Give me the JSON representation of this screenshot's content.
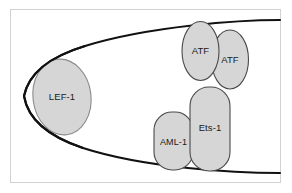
{
  "figure": {
    "background_color": "#ffffff",
    "frame_color": "#d2d2d2",
    "dna_stroke_color": "#111111",
    "protein_fill_color": "#d6d6d6",
    "protein_stroke_color": "#4a4a4a",
    "label_text_color": "#1a1a1a"
  },
  "dna": {
    "name": "bent-dna-strand",
    "description": "Sharply bent DNA duplex forming a loop that opens to the right",
    "upper_strand_label": "upper-dna-strand",
    "lower_strand_label": "lower-dna-strand"
  },
  "proteins": [
    {
      "id": "lef-1",
      "label": "LEF-1",
      "shape": "ellipse",
      "position": "left-apex-of-dna-bend"
    },
    {
      "id": "atf-left",
      "label": "ATF",
      "shape": "ellipse",
      "position": "upper-right-inner"
    },
    {
      "id": "atf-right",
      "label": "ATF",
      "shape": "ellipse",
      "position": "upper-right-outer"
    },
    {
      "id": "ets-1",
      "label": "Ets-1",
      "shape": "rounded-rectangle",
      "position": "lower-right-inner"
    },
    {
      "id": "aml-1",
      "label": "AML-1",
      "shape": "rounded-rectangle",
      "position": "lower-right-left-of-ets1"
    }
  ]
}
